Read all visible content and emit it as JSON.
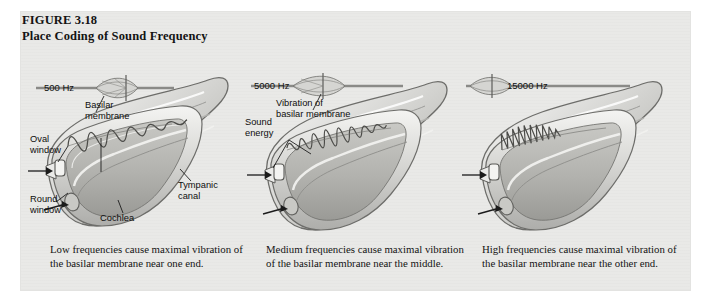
{
  "figure": {
    "number": "FIGURE 3.18",
    "title": "Place Coding of Sound Frequency",
    "background_color": "#e9e9e7",
    "page_color": "#ffffff",
    "ink_color": "#141414"
  },
  "panels": [
    {
      "id": "panel-low",
      "frequency_label": "500 Hz",
      "frequency_hz": 500,
      "envelope_peak_position": 0.34,
      "annotations": [
        {
          "name": "basilar-membrane",
          "text_line1": "Basilar",
          "text_line2": "membrane"
        },
        {
          "name": "oval-window",
          "text_line1": "Oval",
          "text_line2": "window"
        },
        {
          "name": "round-window",
          "text_line1": "Round",
          "text_line2": "window"
        },
        {
          "name": "cochlea",
          "text_line1": "Cochlea",
          "text_line2": ""
        },
        {
          "name": "tympanic-canal",
          "text_line1": "Tympanic",
          "text_line2": "canal"
        }
      ],
      "caption": "Low frequencies cause maximal vibration of the basilar membrane near one end."
    },
    {
      "id": "panel-medium",
      "frequency_label": "5000 Hz",
      "frequency_hz": 5000,
      "envelope_peak_position": 0.5,
      "annotations": [
        {
          "name": "vibration-of-basilar-membrane",
          "text_line1": "Vibration of",
          "text_line2": "basilar membrane"
        },
        {
          "name": "sound-energy",
          "text_line1": "Sound",
          "text_line2": "energy"
        }
      ],
      "caption": "Medium frequencies cause maximal vibration of the basilar membrane near the middle."
    },
    {
      "id": "panel-high",
      "frequency_label": "15000 Hz",
      "frequency_hz": 15000,
      "envelope_peak_position": 0.12,
      "annotations": [],
      "caption": "High frequencies cause maximal vibration of the basilar membrane near the other end."
    }
  ]
}
